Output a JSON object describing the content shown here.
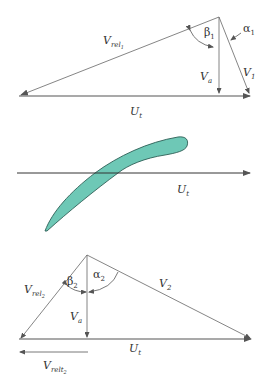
{
  "colors": {
    "line": "#555555",
    "blade_fill": "#6ec8b6",
    "blade_stroke": "#2e5f56",
    "text": "#333333",
    "background": "#ffffff"
  },
  "inlet_triangle": {
    "vrel": {
      "main": "V",
      "sub": "rel",
      "subsub": "1"
    },
    "beta": {
      "main": "β",
      "sub": "1"
    },
    "alpha": {
      "main": "α",
      "sub": "1"
    },
    "va": {
      "main": "V",
      "sub": "a"
    },
    "v": {
      "main": "V",
      "sub": "1"
    },
    "ut": {
      "main": "U",
      "sub": "t"
    }
  },
  "blade": {
    "ut": {
      "main": "U",
      "sub": "t"
    }
  },
  "outlet_triangle": {
    "vrel": {
      "main": "V",
      "sub": "rel",
      "subsub": "2"
    },
    "beta": {
      "main": "β",
      "sub": "2"
    },
    "alpha": {
      "main": "α",
      "sub": "2"
    },
    "va": {
      "main": "V",
      "sub": "a"
    },
    "v": {
      "main": "V",
      "sub": "2"
    },
    "ut": {
      "main": "U",
      "sub": "t"
    },
    "vrelt": {
      "main": "V",
      "sub": "relt",
      "subsub": "2"
    }
  }
}
